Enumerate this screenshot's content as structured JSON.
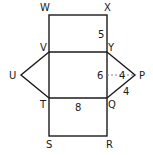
{
  "diagram": {
    "type": "net of triangular prism",
    "vertices": {
      "W": "W",
      "X": "X",
      "V": "V",
      "Y": "Y",
      "U": "U",
      "P": "P",
      "T": "T",
      "Q": "Q",
      "S": "S",
      "R": "R"
    },
    "measurements": {
      "XY": "5",
      "YQ": "6",
      "P_height": "4",
      "QP": "4",
      "TQ": "8"
    },
    "colors": {
      "line": "#1a1a1a",
      "dashed": "#888888",
      "background": "#ffffff"
    }
  }
}
